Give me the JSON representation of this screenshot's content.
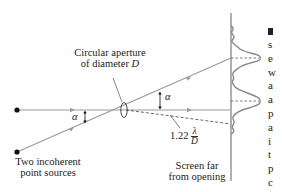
{
  "figure": {
    "labels": {
      "aperture_line1": "Circular aperture",
      "aperture_line2_prefix": "of diameter ",
      "aperture_line2_var": "D",
      "sources_line1": "Two incoherent",
      "sources_line2": "point sources",
      "screen_line1": "Screen far",
      "screen_line2": "from opening",
      "alpha_left": "α",
      "alpha_right": "α",
      "resolution_coef": "1.22",
      "resolution_num": "λ",
      "resolution_den": "D"
    },
    "colors": {
      "ray": "#9a9a9a",
      "screen": "#b0b0b0",
      "curve": "#8a8a8a",
      "dashed": "#555555",
      "source_dot": "#111111",
      "text": "#222222"
    }
  },
  "adjacent_page_fragments": [
    "s",
    "e",
    "w",
    "a",
    "a",
    "p",
    "a",
    "i",
    "t",
    "p",
    "c"
  ]
}
